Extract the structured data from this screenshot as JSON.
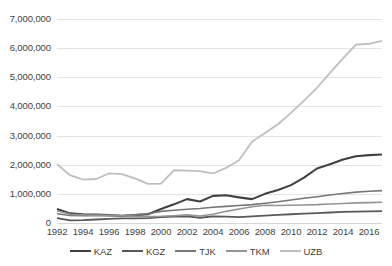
{
  "chart_data": {
    "type": "line",
    "title": "",
    "subtitle": "",
    "xlabel": "",
    "ylabel": "",
    "grid": true,
    "legend_position": "bottom",
    "ylim": [
      0,
      7000000
    ],
    "ytick_labels": [
      "0",
      "1,000,000",
      "2,000,000",
      "3,000,000",
      "4,000,000",
      "5,000,000",
      "6,000,000",
      "7,000,000"
    ],
    "ytick_values": [
      0,
      1000000,
      2000000,
      3000000,
      4000000,
      5000000,
      6000000,
      7000000
    ],
    "xlim": [
      1992,
      2017
    ],
    "xtick_labels": [
      "1992",
      "1994",
      "1996",
      "1998",
      "2000",
      "2002",
      "2004",
      "2006",
      "2008",
      "2010",
      "2012",
      "2014",
      "2016"
    ],
    "xtick_values": [
      1992,
      1994,
      1996,
      1998,
      2000,
      2002,
      2004,
      2006,
      2008,
      2010,
      2012,
      2014,
      2016
    ],
    "x": [
      1992,
      1993,
      1994,
      1995,
      1996,
      1997,
      1998,
      1999,
      2000,
      2001,
      2002,
      2003,
      2004,
      2005,
      2006,
      2007,
      2008,
      2009,
      2010,
      2011,
      2012,
      2013,
      2014,
      2015,
      2016,
      2017
    ],
    "series": [
      {
        "name": "KAZ",
        "color": "#404040",
        "width": 2.1,
        "values": [
          480000,
          330000,
          300000,
          290000,
          270000,
          250000,
          270000,
          300000,
          480000,
          640000,
          820000,
          740000,
          930000,
          950000,
          880000,
          820000,
          1000000,
          1130000,
          1300000,
          1560000,
          1870000,
          2020000,
          2180000,
          2290000,
          2330000,
          2350000
        ]
      },
      {
        "name": "KGZ",
        "color": "#595959",
        "width": 1.8,
        "values": [
          170000,
          90000,
          100000,
          120000,
          140000,
          160000,
          160000,
          170000,
          200000,
          220000,
          230000,
          180000,
          230000,
          220000,
          200000,
          230000,
          250000,
          280000,
          300000,
          320000,
          340000,
          360000,
          380000,
          390000,
          400000,
          410000
        ]
      },
      {
        "name": "TJK",
        "color": "#767676",
        "width": 1.6,
        "values": [
          320000,
          260000,
          250000,
          250000,
          250000,
          250000,
          280000,
          320000,
          400000,
          440000,
          470000,
          500000,
          540000,
          570000,
          600000,
          630000,
          680000,
          730000,
          790000,
          850000,
          900000,
          960000,
          1010000,
          1060000,
          1090000,
          1110000
        ]
      },
      {
        "name": "TKM",
        "color": "#949494",
        "width": 1.6,
        "values": [
          420000,
          300000,
          280000,
          270000,
          260000,
          250000,
          230000,
          220000,
          230000,
          250000,
          280000,
          240000,
          300000,
          400000,
          480000,
          560000,
          610000,
          600000,
          610000,
          620000,
          630000,
          650000,
          670000,
          690000,
          700000,
          710000
        ]
      },
      {
        "name": "UZB",
        "color": "#bfbfbf",
        "width": 1.8,
        "values": [
          2020000,
          1640000,
          1490000,
          1510000,
          1700000,
          1680000,
          1530000,
          1340000,
          1350000,
          1810000,
          1800000,
          1780000,
          1700000,
          1890000,
          2150000,
          2790000,
          3090000,
          3390000,
          3780000,
          4200000,
          4640000,
          5150000,
          5650000,
          6120000,
          6150000,
          6250000
        ]
      }
    ]
  },
  "legend": {
    "entries": [
      {
        "label": "KAZ"
      },
      {
        "label": "KGZ"
      },
      {
        "label": "TJK"
      },
      {
        "label": "TKM"
      },
      {
        "label": "UZB"
      }
    ]
  }
}
